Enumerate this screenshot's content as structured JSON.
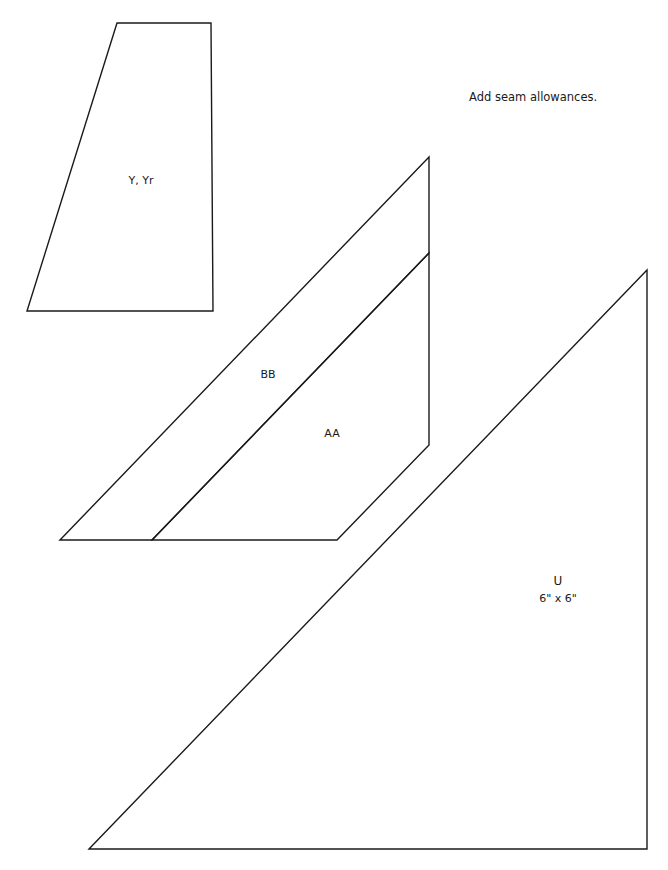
{
  "page": {
    "instruction": "Add seam allowances."
  },
  "pieces": {
    "y": {
      "label": "Y, Yr"
    },
    "bb": {
      "label": "BB"
    },
    "aa": {
      "label": "AA"
    },
    "u": {
      "label": "U",
      "size": "6\" x 6\""
    }
  },
  "colors": {
    "line": "#1a1a1a",
    "background": "#ffffff"
  }
}
